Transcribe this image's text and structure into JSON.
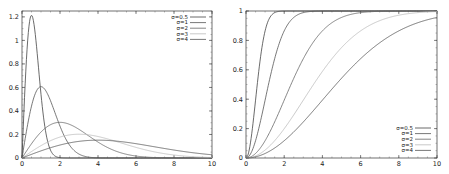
{
  "chart_data": [
    {
      "type": "line",
      "title": "",
      "xlabel": "",
      "ylabel": "",
      "xlim": [
        0,
        10
      ],
      "ylim": [
        0,
        1.25
      ],
      "x_ticks": [
        "0",
        "2",
        "4",
        "6",
        "8",
        "10"
      ],
      "y_ticks": [
        "0",
        "0.2",
        "0.4",
        "0.6",
        "0.8",
        "1",
        "1.2"
      ],
      "grid": false,
      "legend_position": "upper right",
      "function": "rayleigh_pdf",
      "series": [
        {
          "name": "σ=0.5",
          "sigma": 0.5,
          "color": "#444444",
          "peak": {
            "x": 0.5,
            "y": 1.21
          }
        },
        {
          "name": "σ=1",
          "sigma": 1,
          "color": "#555555",
          "peak": {
            "x": 1,
            "y": 0.61
          }
        },
        {
          "name": "σ=2",
          "sigma": 2,
          "color": "#666666",
          "peak": {
            "x": 2,
            "y": 0.3
          }
        },
        {
          "name": "σ=3",
          "sigma": 3,
          "color": "#bbbbbb",
          "peak": {
            "x": 3,
            "y": 0.2
          }
        },
        {
          "name": "σ=4",
          "sigma": 4,
          "color": "#555555",
          "peak": {
            "x": 4,
            "y": 0.15
          }
        }
      ]
    },
    {
      "type": "line",
      "title": "",
      "xlabel": "",
      "ylabel": "",
      "xlim": [
        0,
        10
      ],
      "ylim": [
        0,
        1
      ],
      "x_ticks": [
        "0",
        "2",
        "4",
        "6",
        "8",
        "10"
      ],
      "y_ticks": [
        "0",
        "0.2",
        "0.4",
        "0.6",
        "0.8",
        "1"
      ],
      "grid": false,
      "legend_position": "lower right",
      "function": "rayleigh_cdf",
      "series": [
        {
          "name": "σ=0.5",
          "sigma": 0.5,
          "color": "#444444"
        },
        {
          "name": "σ=1",
          "sigma": 1,
          "color": "#555555"
        },
        {
          "name": "σ=2",
          "sigma": 2,
          "color": "#666666"
        },
        {
          "name": "σ=3",
          "sigma": 3,
          "color": "#bbbbbb"
        },
        {
          "name": "σ=4",
          "sigma": 4,
          "color": "#555555"
        }
      ]
    }
  ]
}
